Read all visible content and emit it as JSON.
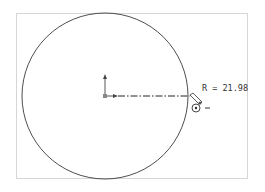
{
  "canvas": {
    "type": "sketch-viewport",
    "frame_color": "#d6d6d6",
    "line_color": "#333333"
  },
  "sketch": {
    "entity": "circle",
    "center": {
      "x": 105,
      "y": 96
    },
    "radius_px": 83
  },
  "dimension": {
    "label": "R = 21.98",
    "line_style": "dash-dot"
  },
  "cursor": {
    "icon": "pencil-circle-cursor",
    "mode_glyph": "-"
  },
  "origin": {
    "icon": "origin-axes-icon"
  }
}
